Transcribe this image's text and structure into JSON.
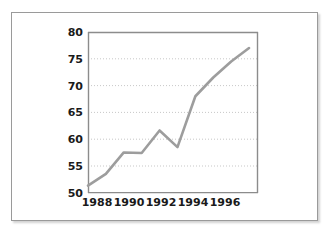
{
  "figure": {
    "background_color": "#ffffff",
    "frame_color": "#9a9a9a"
  },
  "chart_data": {
    "type": "line",
    "title": "",
    "subtitle": "",
    "xlabel": "",
    "ylabel": "",
    "x": [
      1988,
      1989,
      1990,
      1991,
      1992,
      1993,
      1994,
      1995,
      1996,
      1997
    ],
    "values": [
      51.3,
      53.5,
      57.5,
      57.4,
      61.6,
      58.5,
      68.0,
      71.5,
      74.5,
      77.0
    ],
    "series": [
      {
        "name": "series-1",
        "color": "#9d9d9d",
        "values": [
          51.3,
          53.5,
          57.5,
          57.4,
          61.6,
          58.5,
          68.0,
          71.5,
          74.5,
          77.0
        ]
      }
    ],
    "xlim": [
      1988,
      1997.5
    ],
    "ylim": [
      50,
      80
    ],
    "yticks": [
      50,
      55,
      60,
      65,
      70,
      75,
      80
    ],
    "ytick_labels": [
      "50",
      "55",
      "60",
      "65",
      "70",
      "75",
      "80"
    ],
    "xticks": [
      1988,
      1990,
      1992,
      1994,
      1996
    ],
    "xtick_labels": [
      "1988",
      "1990",
      "1992",
      "1994",
      "1996"
    ],
    "grid": "horizontal-dotted",
    "legend": "none",
    "line_color": "#9d9d9d",
    "gridline_color": "#b9b9b9",
    "axis_color": "#8c8c8c",
    "annotations": []
  },
  "axis": {
    "y_labels": [
      "80",
      "75",
      "70",
      "65",
      "60",
      "55",
      "50"
    ],
    "x_labels": [
      "1988",
      "1990",
      "1992",
      "1994",
      "1996"
    ]
  }
}
